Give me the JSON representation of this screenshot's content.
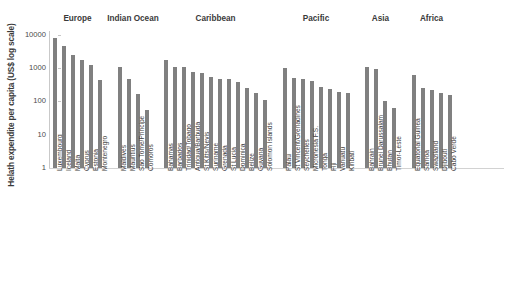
{
  "chart_data": {
    "type": "bar",
    "title": "",
    "xlabel": "",
    "ylabel": "Helath expendite per capita (US$ log scale)",
    "yscale": "log",
    "ylim": [
      1,
      10000
    ],
    "ytick_labels": [
      "10000",
      "1000",
      "100",
      "10",
      "1"
    ],
    "ytick_values": [
      10000,
      1000,
      100,
      10,
      1
    ],
    "grid": false,
    "legend": "none",
    "bar_color": "#808080",
    "groups": [
      {
        "name": "Europe",
        "categories": [
          "Luxembourg",
          "Iceland",
          "Malta",
          "Cyprus",
          "Estonia",
          "Montenegro"
        ],
        "values": [
          8000,
          4600,
          2400,
          1800,
          1200,
          440
        ]
      },
      {
        "name": "Indian Ocean",
        "categories": [
          "Maldives",
          "Mauritius",
          "Sao Tome/Principe",
          "Comoros"
        ],
        "values": [
          1100,
          470,
          165,
          55
        ]
      },
      {
        "name": "Caribbean",
        "categories": [
          "Bahamas",
          "Barbados",
          "Trinidad/Tobago",
          "Antigua/Barbuda",
          "St Kitts/Nevis",
          "Suriname",
          "Grenada",
          "St Lucia",
          "Dominica",
          "Belize",
          "Guyana",
          "Solomon Islands"
        ],
        "values": [
          1700,
          1100,
          1050,
          740,
          730,
          530,
          480,
          460,
          370,
          250,
          180,
          110
        ]
      },
      {
        "name": "Pacific",
        "categories": [
          "Palau",
          "St Vincent/Grenadines",
          "Seychelles",
          "Micronesia F.S.",
          "Tonga",
          "Fiji",
          "Vanuatu",
          "Kiribati"
        ],
        "values": [
          1000,
          500,
          470,
          400,
          270,
          240,
          190,
          185
        ]
      },
      {
        "name": "Asia",
        "categories": [
          "Bahrain",
          "Brunei Darussalam",
          "Bhutan",
          "Timor-Leste"
        ],
        "values": [
          1100,
          950,
          100,
          65
        ]
      },
      {
        "name": "Africa",
        "categories": [
          "Equatorial Guinea",
          "Samoa",
          "Swaziland",
          "Djibouti",
          "Cabo Verde"
        ],
        "values": [
          600,
          260,
          220,
          175,
          160
        ]
      }
    ]
  },
  "caption": ""
}
